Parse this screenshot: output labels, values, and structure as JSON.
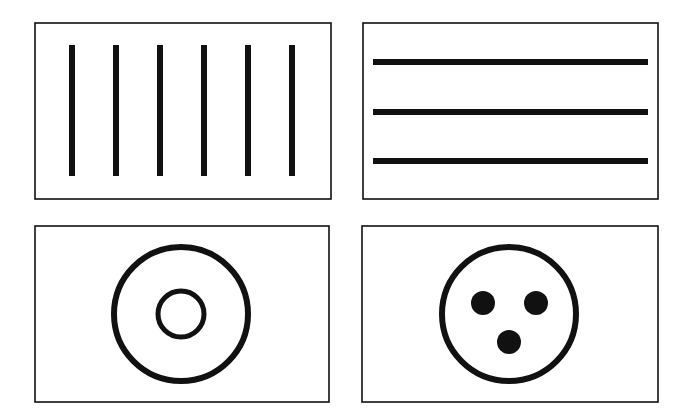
{
  "colors": {
    "background": "#ffffff",
    "stroke": "#111111",
    "fill": "#111111"
  },
  "panels": [
    {
      "id": "vertical-lines",
      "box": {
        "x": 35,
        "y": 23,
        "w": 296,
        "h": 176
      },
      "bars": {
        "orientation": "vertical",
        "count": 6,
        "positions": [
          72,
          116,
          160,
          204,
          248,
          292
        ],
        "from": 45,
        "to": 176,
        "thickness": 6
      }
    },
    {
      "id": "horizontal-lines",
      "box": {
        "x": 363,
        "y": 23,
        "w": 295,
        "h": 176
      },
      "bars": {
        "orientation": "horizontal",
        "count": 3,
        "positions": [
          62,
          112,
          161
        ],
        "from": 373,
        "to": 648,
        "thickness": 6
      }
    },
    {
      "id": "concentric-circles",
      "box": {
        "x": 35,
        "y": 226,
        "w": 294,
        "h": 176
      },
      "circles": [
        {
          "cx": 181,
          "cy": 314,
          "r": 67,
          "stroke": 6
        },
        {
          "cx": 181,
          "cy": 314,
          "r": 23,
          "stroke": 5
        }
      ]
    },
    {
      "id": "circle-with-dots",
      "box": {
        "x": 362,
        "y": 226,
        "w": 296,
        "h": 176
      },
      "circles": [
        {
          "cx": 509,
          "cy": 314,
          "r": 67,
          "stroke": 6
        }
      ],
      "dots": [
        {
          "cx": 483,
          "cy": 303,
          "r": 12
        },
        {
          "cx": 536,
          "cy": 303,
          "r": 12
        },
        {
          "cx": 509,
          "cy": 342,
          "r": 12
        }
      ]
    }
  ]
}
